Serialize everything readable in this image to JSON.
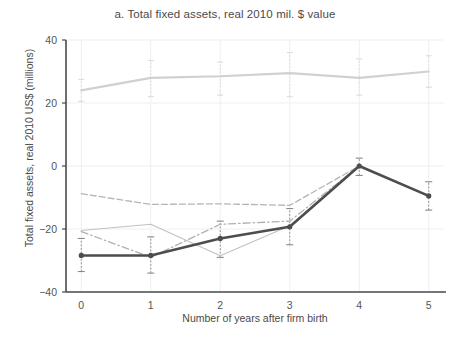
{
  "chart_data": {
    "type": "line",
    "title": "a. Total fixed assets, real 2010 mil. $ value",
    "xlabel": "Number of years after firm birth",
    "ylabel": "Total fixed assets, real 2010 US$ (millions)",
    "x": [
      0,
      1,
      2,
      3,
      4,
      5
    ],
    "xtick_labels": [
      "0",
      "1",
      "2",
      "3",
      "4",
      "5"
    ],
    "ytick_labels": [
      "40",
      "20",
      "0",
      "−20",
      "−40"
    ],
    "ytick_values": [
      40,
      20,
      0,
      -20,
      -40
    ],
    "xlim": [
      -0.22,
      5.22
    ],
    "ylim": [
      -40,
      40
    ],
    "grid": true,
    "legend": "none",
    "series": [
      {
        "name": "series-1-light-solid",
        "style": "solid",
        "color": "#d0d0d0",
        "width": 2.2,
        "markers": false,
        "values": [
          24.0,
          28.0,
          28.5,
          29.5,
          28.0,
          30.0
        ],
        "err_low": [
          20.5,
          22.0,
          22.5,
          22.0,
          22.5,
          25.0
        ],
        "err_high": [
          27.5,
          33.5,
          33.0,
          36.0,
          34.0,
          35.0
        ]
      },
      {
        "name": "series-2-dashed",
        "style": "dashed",
        "color": "#b5b5b5",
        "width": 1.3,
        "markers": false,
        "values": [
          -8.8,
          -12.2,
          -12.0,
          -12.5,
          0.0,
          -9.5
        ],
        "err_low": [
          -8.8,
          -12.2,
          -12.0,
          -12.5,
          0.0,
          -9.5
        ],
        "err_high": [
          -8.8,
          -12.2,
          -12.0,
          -12.5,
          0.0,
          -9.5
        ]
      },
      {
        "name": "series-3-dash-dot",
        "style": "dashdot",
        "color": "#b0b0b0",
        "width": 1.3,
        "markers": false,
        "values": [
          -20.8,
          -29.0,
          -18.5,
          -17.5,
          0.0,
          -9.5
        ],
        "err_low": [
          -20.8,
          -29.0,
          -18.5,
          -17.5,
          0.0,
          -9.5
        ],
        "err_high": [
          -20.8,
          -29.0,
          -18.5,
          -17.5,
          0.0,
          -9.5
        ]
      },
      {
        "name": "series-4-thin-solid",
        "style": "solid",
        "color": "#c2c2c2",
        "width": 1.1,
        "markers": false,
        "values": [
          -20.5,
          -18.5,
          -28.5,
          -19.0,
          0.0,
          -9.5
        ],
        "err_low": [
          -20.5,
          -18.5,
          -28.5,
          -19.0,
          0.0,
          -9.5
        ],
        "err_high": [
          -20.5,
          -18.5,
          -28.5,
          -19.0,
          0.0,
          -9.5
        ]
      },
      {
        "name": "series-5-dark-solid",
        "style": "solid",
        "color": "#4d4d4d",
        "width": 2.6,
        "markers": true,
        "values": [
          -28.4,
          -28.4,
          -23.0,
          -19.3,
          0.0,
          -9.5
        ],
        "err_low": [
          -33.5,
          -34.0,
          -29.0,
          -25.0,
          -3.0,
          -14.0
        ],
        "err_high": [
          -23.0,
          -22.5,
          -17.5,
          -13.5,
          2.5,
          -5.0
        ]
      }
    ]
  }
}
